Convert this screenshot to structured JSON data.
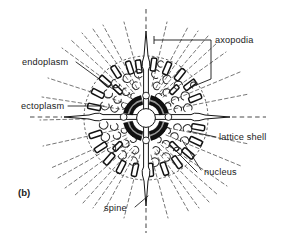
{
  "figure": {
    "panel_label": "(b)",
    "background_color": "#ffffff",
    "ink_color": "#141414",
    "axopodia_color": "#5d5d5d",
    "width": 291,
    "height": 240
  },
  "labels": {
    "endoplasm": "endoplasm",
    "ectoplasm": "ectoplasm",
    "axopodia": "axopodia",
    "lattice_shell": "lattice shell",
    "nucleus": "nucleus",
    "spine": "spine"
  },
  "structures": {
    "central_capsule": "central-capsule-ring",
    "nucleus_core": "nucleus-core",
    "axial_spines": [
      "spine-north",
      "spine-south",
      "spine-west",
      "spine-east"
    ],
    "axis_lines": [
      "axis-vertical",
      "axis-horizontal"
    ],
    "lattice_segments": 24,
    "vacuole_count": 46,
    "axopodia_count": 34
  }
}
